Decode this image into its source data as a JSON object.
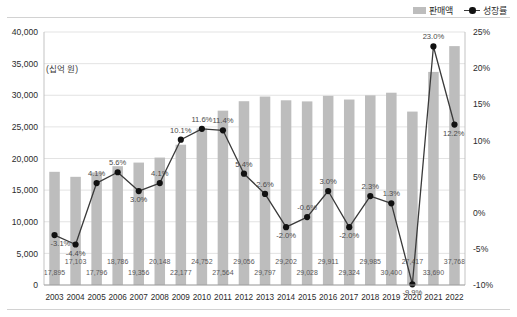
{
  "legend": {
    "position": "top-right",
    "items": [
      {
        "label": "판매액",
        "marker": "bar-swatch-icon",
        "color": "#bdbdbd"
      },
      {
        "label": "성장률",
        "marker": "line-dot-icon",
        "color": "#111111"
      }
    ]
  },
  "unit_caption": "(십억 원)",
  "chart_data": {
    "type": "bar",
    "title": "",
    "subtitle": "",
    "xlabel": "",
    "ylabel": "(십억 원)",
    "grid": true,
    "legend_position": "top-right",
    "categories": [
      "2003",
      "2004",
      "2005",
      "2006",
      "2007",
      "2008",
      "2009",
      "2010",
      "2011",
      "2012",
      "2013",
      "2014",
      "2015",
      "2016",
      "2017",
      "2018",
      "2019",
      "2020",
      "2021",
      "2022"
    ],
    "axes": {
      "left": {
        "label": "(십억 원)",
        "min": 0,
        "max": 40000,
        "step": 5000,
        "ticks": [
          "0",
          "5,000",
          "10,000",
          "15,000",
          "20,000",
          "25,000",
          "30,000",
          "35,000",
          "40,000"
        ],
        "tick_values": [
          0,
          5000,
          10000,
          15000,
          20000,
          25000,
          30000,
          35000,
          40000
        ]
      },
      "right": {
        "label": "",
        "min": -10,
        "max": 25,
        "step": 5,
        "ticks": [
          "-10%",
          "-5%",
          "0%",
          "5%",
          "10%",
          "15%",
          "20%",
          "25%"
        ],
        "tick_values": [
          -10,
          -5,
          0,
          5,
          10,
          15,
          20,
          25
        ]
      }
    },
    "series": [
      {
        "name": "판매액",
        "type": "bar",
        "axis": "left",
        "color": "#bdbdbd",
        "values": [
          17895,
          17103,
          17796,
          18786,
          19356,
          20148,
          22177,
          24752,
          27564,
          29056,
          29797,
          29202,
          29028,
          29911,
          29324,
          29985,
          30400,
          27417,
          33690,
          37768
        ],
        "labels": [
          "17,895",
          "17,103",
          "17,796",
          "18,786",
          "19,356",
          "20,148",
          "22,177",
          "24,752",
          "27,564",
          "29,056",
          "29,797",
          "29,202",
          "29,028",
          "29,911",
          "29,324",
          "29,985",
          "30,400",
          "27,417",
          "33,690",
          "37,768"
        ]
      },
      {
        "name": "성장률",
        "type": "line",
        "axis": "right",
        "color": "#111111",
        "values": [
          -3.1,
          -4.4,
          4.1,
          5.6,
          3.0,
          4.1,
          10.1,
          11.6,
          11.4,
          5.4,
          2.6,
          -2.0,
          -0.6,
          3.0,
          -2.0,
          2.3,
          1.3,
          -9.9,
          23.0,
          12.2
        ],
        "labels": [
          "-3.1%",
          "-4.4%",
          "4.1%",
          "5.6%",
          "3.0%",
          "4.1%",
          "10.1%",
          "11.6%",
          "11.4%",
          "5.4%",
          "2.6%",
          "-2.0%",
          "-0.6%",
          "3.0%",
          "-2.0%",
          "2.3%",
          "1.3%",
          "-9.9%",
          "23.0%",
          "12.2%"
        ]
      }
    ]
  }
}
